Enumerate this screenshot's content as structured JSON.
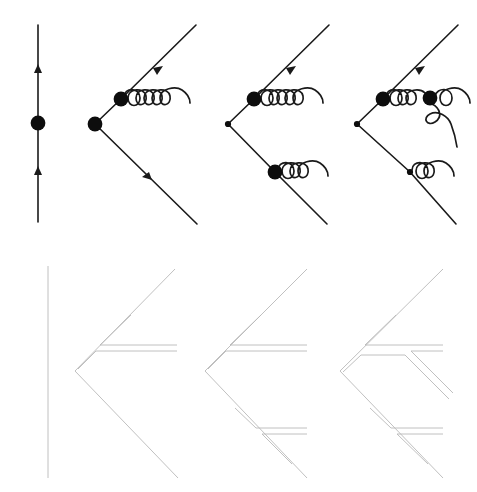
{
  "figure": {
    "title": "Feynman diagrams with corresponding colour-flow diagrams",
    "width": 477,
    "height": 492,
    "background_color": "#ffffff",
    "rows": [
      {
        "row_name": "amplitude-row",
        "description": "Top row: QCD Feynman diagrams drawn with solid black fermion lines, filled circular vertex blobs, arrowheads on fermion lines, and curly gluon lines.",
        "line_color": "#1a1a1a",
        "blob_color": "#0d0d0d"
      },
      {
        "row_name": "colour-flow-row",
        "description": "Bottom row: corresponding large-N colour-flow (double-line) diagrams drawn with thin light grey lines.",
        "line_color": "#b9b9b9"
      }
    ],
    "panels": [
      {
        "index": 1,
        "name": "panel-born-vertical-line",
        "amplitude": {
          "name": "diagram-vertical-propagator",
          "fermion_lines": 1,
          "vertex_blobs": 1,
          "arrowheads": 2,
          "gluons": 0,
          "arrow_direction": "up"
        },
        "colour_flow": {
          "name": "flow-single-vertical-line",
          "flow_lines": 1,
          "shape": "straight vertical"
        }
      },
      {
        "index": 2,
        "name": "panel-one-gluon-upper",
        "amplitude": {
          "name": "diagram-single-gluon-emission",
          "fermion_lines": 2,
          "vertex_blobs": 2,
          "arrowheads": 2,
          "gluons": 1,
          "gluon_loops": 5,
          "gluon_position": "upper-branch"
        },
        "colour_flow": {
          "name": "flow-one-gluon",
          "flow_lines": 3,
          "shape": "open chevron with one horizontal double line"
        }
      },
      {
        "index": 3,
        "name": "panel-two-gluons",
        "amplitude": {
          "name": "diagram-double-gluon-emission",
          "fermion_lines": 2,
          "vertex_blobs": 3,
          "arrowheads": 2,
          "gluons": 2,
          "gluon_loops": [
            5,
            3
          ],
          "gluon_position": "upper-branch and lower-branch"
        },
        "colour_flow": {
          "name": "flow-two-gluons",
          "flow_lines": 4,
          "shape": "open chevron with two horizontal double lines"
        }
      },
      {
        "index": 4,
        "name": "panel-triple-gluon-vertex",
        "amplitude": {
          "name": "diagram-gluon-splitting",
          "fermion_lines": 2,
          "vertex_blobs": 3,
          "arrowheads": 2,
          "gluons": 4,
          "gluon_loops": [
            3,
            2,
            2
          ],
          "gluon_position": "upper-branch with triple-gluon vertex, plus lower-branch gluon"
        },
        "colour_flow": {
          "name": "flow-gluon-splitting",
          "flow_lines": 5,
          "shape": "open chevron with branching double line"
        }
      }
    ]
  }
}
